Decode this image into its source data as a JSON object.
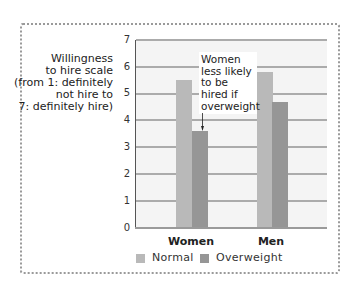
{
  "chart_data": {
    "type": "bar",
    "title": "",
    "categories": [
      "Women",
      "Men"
    ],
    "series": [
      {
        "name": "Normal",
        "values": [
          5.5,
          5.8
        ],
        "color": "#b9b9b9"
      },
      {
        "name": "Overweight",
        "values": [
          3.6,
          4.7
        ],
        "color": "#969696"
      }
    ],
    "xlabel": "",
    "ylabel_lines": [
      "Willingness",
      "to hire scale",
      "(from 1: definitely",
      "not hire to",
      "7: definitely hire)"
    ],
    "ylabel": "Willingness to hire scale (from 1: definitely not hire to 7: definitely hire)",
    "ylim": [
      0,
      7
    ],
    "yticks": [
      "0",
      "1",
      "2",
      "3",
      "4",
      "5",
      "6",
      "7"
    ],
    "grid": true,
    "legend": {
      "position": "bottom",
      "entries": [
        "Normal",
        "Overweight"
      ]
    },
    "annotation": {
      "lines": [
        "Women",
        "less likely",
        "to be",
        "hired if",
        "overweight"
      ],
      "text": "Women less likely to be hired if overweight",
      "points_to": {
        "category": "Women",
        "series": "Overweight"
      }
    }
  },
  "colors": {
    "normal": "#b9b9b9",
    "overweight": "#969696",
    "plot_background": "#f4f4f4",
    "gridline": "#ababab",
    "frame_border": "#9a9a9a"
  }
}
